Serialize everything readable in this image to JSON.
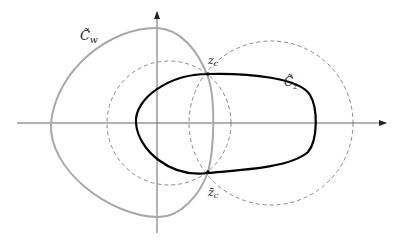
{
  "diagram": {
    "type": "contour-diagram",
    "labels": {
      "curve_w": "C̃",
      "curve_w_sub": "w",
      "curve_z": "C̃",
      "curve_z_sub": "z",
      "point_top": "z",
      "point_top_sub": "c",
      "point_bottom": "z̄",
      "point_bottom_sub": "c"
    },
    "elements": [
      {
        "name": "real-axis",
        "style": "solid gray with arrow"
      },
      {
        "name": "imaginary-axis",
        "style": "solid gray with arrow"
      },
      {
        "name": "curve-c-w",
        "style": "solid light gray"
      },
      {
        "name": "curve-c-z",
        "style": "solid black"
      },
      {
        "name": "left-dashed-circle",
        "style": "dashed gray"
      },
      {
        "name": "right-dashed-circle",
        "style": "dashed gray"
      }
    ],
    "colors": {
      "axis": "#555555",
      "curve_w": "#a8a8a8",
      "curve_z": "#000000",
      "dashed": "#888888"
    }
  }
}
